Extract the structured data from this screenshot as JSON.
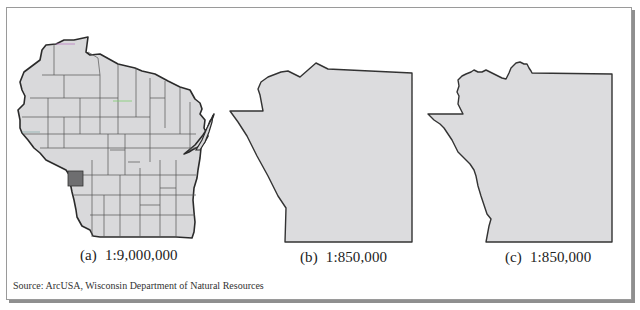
{
  "figure": {
    "panels": [
      {
        "id": "a",
        "letter": "(a)",
        "scale": "1:9,000,000",
        "subject": "Wisconsin counties with one county highlighted",
        "fill_color": "#d9d9db",
        "highlight_color": "#6e6e70",
        "outline_color": "#333333"
      },
      {
        "id": "b",
        "letter": "(b)",
        "scale": "1:850,000",
        "subject": "Highlighted county outline, generalized",
        "fill_color": "#dcdcde",
        "outline_color": "#333333"
      },
      {
        "id": "c",
        "letter": "(c)",
        "scale": "1:850,000",
        "subject": "Highlighted county outline, detailed",
        "fill_color": "#dcdcde",
        "outline_color": "#333333"
      }
    ],
    "source": "Source: ArcUSA, Wisconsin Department of Natural Resources"
  }
}
